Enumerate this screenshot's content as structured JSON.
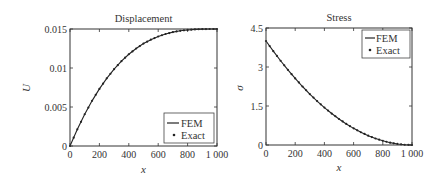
{
  "chart_data": [
    {
      "type": "line",
      "title": "Displacement",
      "xlabel": "x",
      "ylabel": "U",
      "xlim": [
        0,
        1000
      ],
      "ylim": [
        0,
        0.015
      ],
      "xticks": [
        "0",
        "200",
        "400",
        "600",
        "800",
        "1 000"
      ],
      "yticks": [
        "0",
        "0.005",
        "0.01",
        "0.015"
      ],
      "grid": false,
      "legend_position": "lower right",
      "x": [
        0,
        50,
        100,
        150,
        200,
        250,
        300,
        350,
        400,
        450,
        500,
        550,
        600,
        650,
        700,
        750,
        800,
        850,
        900,
        950,
        1000
      ],
      "series": [
        {
          "name": "FEM",
          "style": "solid line",
          "values": [
            0,
            0.00214,
            0.00407,
            0.00579,
            0.00732,
            0.00867,
            0.00985,
            0.01088,
            0.01176,
            0.0125,
            0.01313,
            0.01363,
            0.01404,
            0.01436,
            0.0146,
            0.01477,
            0.01488,
            0.01495,
            0.01499,
            0.015,
            0.015
          ]
        },
        {
          "name": "Exact",
          "style": "dots",
          "values": [
            0,
            0.00214,
            0.00407,
            0.00579,
            0.00732,
            0.00867,
            0.00985,
            0.01088,
            0.01176,
            0.0125,
            0.01313,
            0.01363,
            0.01404,
            0.01436,
            0.0146,
            0.01477,
            0.01488,
            0.01495,
            0.01499,
            0.015,
            0.015
          ]
        }
      ]
    },
    {
      "type": "line",
      "title": "Stress",
      "xlabel": "x",
      "ylabel": "σ",
      "xlim": [
        0,
        1000
      ],
      "ylim": [
        0,
        4.5
      ],
      "xticks": [
        "0",
        "200",
        "400",
        "600",
        "800",
        "1 000"
      ],
      "yticks": [
        "0",
        "1.5",
        "3",
        "4.5"
      ],
      "grid": false,
      "legend_position": "upper right",
      "x": [
        0,
        50,
        100,
        150,
        200,
        250,
        300,
        350,
        400,
        450,
        500,
        550,
        600,
        650,
        700,
        750,
        800,
        850,
        900,
        950,
        1000
      ],
      "series": [
        {
          "name": "FEM",
          "style": "solid line",
          "values": [
            4.0,
            3.61,
            3.24,
            2.89,
            2.56,
            2.25,
            1.96,
            1.69,
            1.44,
            1.21,
            1.0,
            0.81,
            0.64,
            0.49,
            0.36,
            0.25,
            0.16,
            0.09,
            0.04,
            0.01,
            0.0
          ]
        },
        {
          "name": "Exact",
          "style": "dots",
          "values": [
            4.0,
            3.61,
            3.24,
            2.89,
            2.56,
            2.25,
            1.96,
            1.69,
            1.44,
            1.21,
            1.0,
            0.81,
            0.64,
            0.49,
            0.36,
            0.25,
            0.16,
            0.09,
            0.04,
            0.01,
            0.0
          ]
        }
      ]
    }
  ],
  "colors": {
    "line": "#222222",
    "axis": "#333333",
    "background": "#ffffff"
  }
}
